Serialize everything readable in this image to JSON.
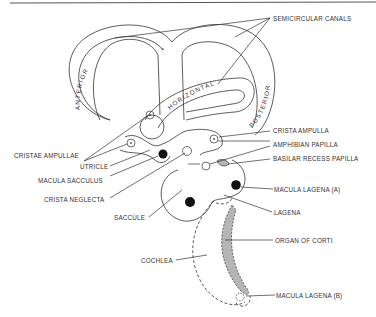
{
  "diagram": {
    "canal_labels": {
      "anterior": "ANTERIOR",
      "horizontal": "HORIZONTAL",
      "posterior": "POSTERIOR"
    },
    "labels": {
      "semicircular_canals": "SEMICIRCULAR CANALS",
      "cristae_ampullae": "CRISTAE AMPULLAE",
      "crista_ampulla": "CRISTA AMPULLA",
      "amphibian_papilla": "AMPHIBIAN PAPILLA",
      "basilar_recess_papilla": "BASILAR RECESS PAPILLA",
      "utricle": "UTRICLE",
      "macula_sacculus": "MACULA SACCULUS",
      "crista_neglecta": "CRISTA NEGLECTA",
      "saccule": "SACCULE",
      "macula_lagena_a": "MACULA LAGENA (A)",
      "lagena": "LAGENA",
      "organ_of_corti": "ORGAN OF CORTI",
      "cochlea": "COCHLEA",
      "macula_lagena_b": "MACULA LAGENA (B)"
    },
    "colors": {
      "line": "#333333",
      "fill_shaded": "#b5b5b5",
      "fill_dark": "#111111",
      "background": "#ffffff"
    }
  }
}
